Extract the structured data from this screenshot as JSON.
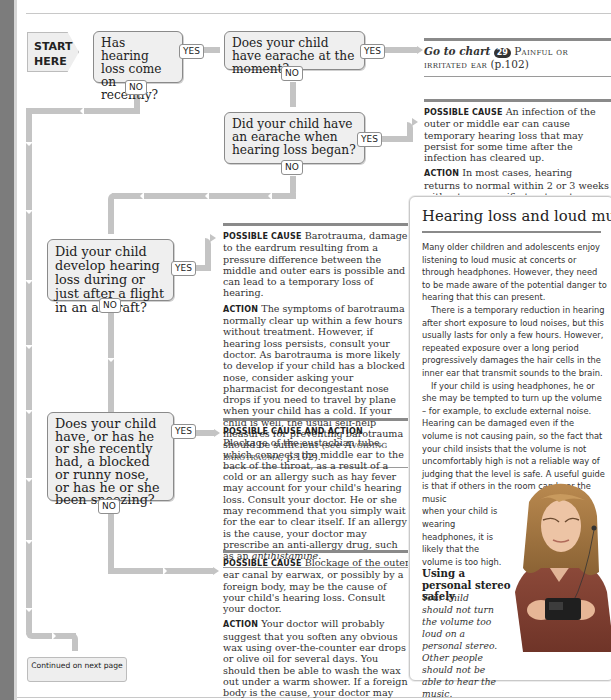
{
  "flowchart": {
    "start_label_line1": "START",
    "start_label_line2": "HERE",
    "questions": [
      {
        "id": "q1",
        "text": "Has hearing loss come on recently?",
        "yes": "YES",
        "no": "NO"
      },
      {
        "id": "q2",
        "text": "Does your child have earache at the moment?",
        "yes": "YES",
        "no": "NO"
      },
      {
        "id": "q3",
        "text": "Did your child have an earache when hearing loss began?",
        "yes": "YES",
        "no": "NO"
      },
      {
        "id": "q4",
        "text": "Did your child develop hearing loss during or just after a flight in an aircraft?",
        "yes": "YES",
        "no": "NO"
      },
      {
        "id": "q5",
        "text": "Does your child have, or has he or she recently had, a blocked or runny nose, or has he or she been sneezing?",
        "yes": "YES",
        "no": "NO"
      }
    ],
    "continued": "Continued on next page"
  },
  "answers": {
    "goto": {
      "prefix": "Go to chart",
      "chart_number": "29",
      "chart_name": "Painful or irritated ear",
      "page": "(p.102)"
    },
    "earache": {
      "cause_label": "Possible cause",
      "cause_text": "An infection of the outer or middle ear can cause temporary hearing loss that may persist for some time after the infection has cleared up.",
      "action_label": "Action",
      "action_text": "In most cases, hearing returns to normal within 2 or 3 weeks without any specific treatment. Consult your doctor if your child's hearing loss persists or worsens. There may be an accumulation of fluid in the middle ear or debris in the ear canal."
    },
    "barotrauma": {
      "cause_label": "Possible cause",
      "cause_text": "Barotrauma, damage to the eardrum resulting from a pressure difference between the middle and outer ears is possible and can lead to a temporary loss of hearing.",
      "action_label": "Action",
      "action_text": "The symptoms of barotrauma normally clear up within a few hours without treatment. However, if hearing loss persists, consult your doctor. As barotrauma is more likely to develop if your child has a blocked nose, consider asking your pharmacist for decongestant nose drops if you need to travel by plane when your child has a cold. If your child is well, the usual self-help measures for preventing barotrauma should be sufficient",
      "ref_see": "see",
      "ref_name": "Avoiding barotrauma",
      "ref_page": ", p.102)."
    },
    "eustachian": {
      "label": "Possible cause and action",
      "text_main": "Blockage of the eustachian tube, which connects the middle ear to the back of the throat, as a result of a cold or an allergy such as hay fever may account for your child's hearing loss. Consult your doctor. He or she may recommend that you simply wait for the ear to clear itself. If an allergy is the cause, your doctor may prescribe an anti-allergy drug, such as an",
      "text_italic": "antihistamine",
      "text_end": "."
    },
    "earwax": {
      "cause_label": "Possible cause",
      "cause_text": "Blockage of the outer ear canal by earwax, or possibly by a foreign body, may be the cause of your child's hearing loss. Consult your doctor.",
      "action_label": "Action",
      "action_text": "Your doctor will probably suggest that you soften any obvious wax using over-the-counter ear drops or olive oil for several days. You should then be able to wash the wax out under a warm shower. If a foreign body is the cause, your doctor may refer your child to a hospital to have it removed."
    }
  },
  "sidebar": {
    "title": "Hearing loss and loud music",
    "p1": "Many older children and adolescents enjoy listening to loud music at concerts or through headphones. However, they need to be made aware of the potential danger to hearing that this can present.",
    "p2": "There is a temporary reduction in hearing after short exposure to loud noises, but this usually lasts for only a few hours. However, repeated exposure over a long period progressively damages the hair cells in the inner ear that transmit sounds to the brain.",
    "p3a": "If your child is using headphones, he or she may be tempted to turn up the volume – for example, to exclude external noise. Hearing can be damaged even if the volume is not causing pain, so the fact that your child insists that the volume is not uncomfortably high is not a reliable way of judging that the level is safe. A useful guide is that if others in the room can hear the music",
    "p3b": "when your child is wearing headphones, it is likely that the volume is too high.",
    "caption_title": "Using a personal stereo safely",
    "caption_text": "Your child should not turn the volume too loud on a personal stereo. Other people should not be able to hear the music.",
    "photo_alt": "Teenage girl wearing headphones holding a personal stereo"
  }
}
